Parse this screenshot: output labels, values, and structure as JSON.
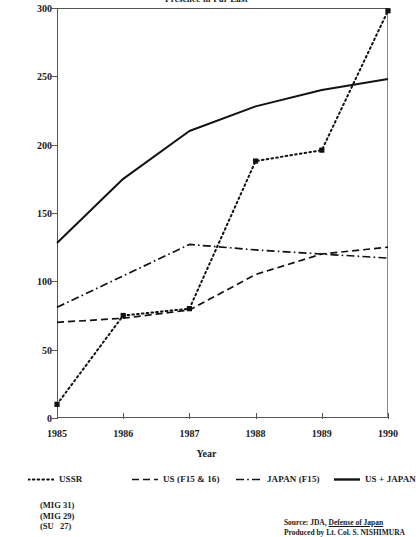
{
  "chart_data": {
    "type": "line",
    "title": "Presence in Far East",
    "xlabel": "Year",
    "ylabel": "",
    "x": [
      1985,
      1986,
      1987,
      1988,
      1989,
      1990
    ],
    "xtick_labels": [
      "1985",
      "1986",
      "1987",
      "1988",
      "1989",
      "1990"
    ],
    "ytick_labels": [
      "0",
      "50",
      "100",
      "150",
      "200",
      "250",
      "300"
    ],
    "yticks": [
      0,
      50,
      100,
      150,
      200,
      250,
      300
    ],
    "ylim": [
      0,
      300
    ],
    "xlim": [
      1985,
      1990
    ],
    "grid": false,
    "legend_position": "below-axis",
    "series": [
      {
        "name": "USSR",
        "style": "dotted",
        "markers": true,
        "values": [
          10,
          75,
          80,
          188,
          196,
          298
        ]
      },
      {
        "name": "US (F15 & 16)",
        "style": "dashed",
        "markers": false,
        "values": [
          70,
          73,
          79,
          105,
          120,
          125
        ]
      },
      {
        "name": "JAPAN (F15)",
        "style": "dash-dot",
        "markers": false,
        "values": [
          81,
          104,
          127,
          123,
          120,
          117
        ]
      },
      {
        "name": "US + JAPAN",
        "style": "solid",
        "markers": false,
        "values": [
          128,
          175,
          210,
          228,
          240,
          248
        ]
      }
    ],
    "annotations": {
      "aircraft": [
        "(MIG 31)",
        "(MIG 29)",
        "(SU   27)"
      ],
      "source_line_1_prefix": "Source: JDA, ",
      "source_line_1_italic": "Defense of Japan",
      "source_line_2": "Produced by Lt. Col. S. NISHIMURA"
    }
  },
  "legend": {
    "items": [
      {
        "label": "USSR",
        "style": "dotted"
      },
      {
        "label": "US (F15 & 16)",
        "style": "dashed"
      },
      {
        "label": "JAPAN (F15)",
        "style": "dash-dot"
      },
      {
        "label": "US + JAPAN",
        "style": "solid"
      }
    ]
  },
  "colors": {
    "line": "#111111",
    "axis": "#555555",
    "background": "#ffffff"
  }
}
